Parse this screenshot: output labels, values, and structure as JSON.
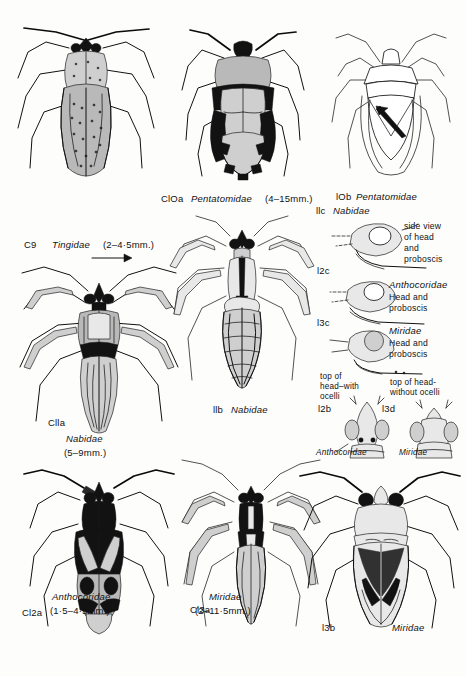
{
  "plate": {
    "title": "Hemiptera identification plate",
    "description": "Line-drawing plate of true bugs (Heteroptera) with keyed figures, family names and body-length ranges",
    "background_color": "#fdfdfc",
    "ink_color": "#111111"
  },
  "figures": [
    {
      "id": "c9",
      "code": "C9",
      "family": "Tingidae",
      "size": "(2–4·5mm.)",
      "caption_parts": [
        "C9",
        "Tingidae",
        "(2–4·5mm.)"
      ],
      "view": "dorsal whole-body, lace bug, heavily stippled",
      "has_arrow": true,
      "arrow_direction": "right"
    },
    {
      "id": "c10a",
      "code": "ClOa",
      "family": "Pentatomidae",
      "size": "(4–15mm.)",
      "caption_parts": [
        "ClOa",
        "Pentatomidae",
        "(4–15mm.)"
      ],
      "view": "dorsal whole-body, shield bug, dense black/grey pattern"
    },
    {
      "id": "f10b",
      "code": "lOb",
      "family": "Pentatomidae",
      "size": "",
      "caption_parts": [
        "lOb",
        "Pentatomidae"
      ],
      "view": "dorsal outline, shield bug with scutellum arrow"
    },
    {
      "id": "f11c",
      "code": "llc",
      "family": "Nabidae",
      "size": "",
      "caption_parts": [
        "llc",
        "Nabidae"
      ],
      "annotation": "side view of head and proboscis",
      "annotation_lines": [
        "side view",
        "of head",
        "and",
        "proboscis"
      ],
      "view": "lateral head detail"
    },
    {
      "id": "f12c",
      "code": "l2c",
      "family": "Anthocoridae",
      "size": "",
      "caption_parts": [
        "l2c",
        "Anthocoridae"
      ],
      "annotation": "Head and proboscis",
      "annotation_lines": [
        "Head and",
        "proboscis"
      ],
      "view": "lateral head detail"
    },
    {
      "id": "f13c",
      "code": "l3c",
      "family": "Miridae",
      "size": "",
      "caption_parts": [
        "l3c",
        "Miridae"
      ],
      "annotation": "Head and proboscis",
      "annotation_lines": [
        "Head and",
        "proboscis"
      ],
      "view": "lateral head detail"
    },
    {
      "id": "c11a",
      "code": "Clla",
      "family": "Nabidae",
      "size": "(5–9mm.)",
      "caption_parts": [
        "Clla",
        "Nabidae",
        "(5–9mm.)"
      ],
      "view": "dorsal whole-body, damsel bug"
    },
    {
      "id": "f11b",
      "code": "llb",
      "family": "Nabidae",
      "size": "",
      "caption_parts": [
        "llb",
        "Nabidae"
      ],
      "view": "dorsal whole-body, short-winged nymph-like form with abdomen banding"
    },
    {
      "id": "f12b",
      "code": "l2b",
      "family": "Anthocoridae",
      "size": "",
      "caption_parts": [
        "l2b",
        "Anthocoridae"
      ],
      "annotation": "top of head-with ocelli",
      "annotation_lines": [
        "top of",
        "head–with",
        "ocelli"
      ],
      "view": "dorsal head detail with two ocelli marked as black dots"
    },
    {
      "id": "f13d",
      "code": "l3d",
      "family": "Miridae",
      "size": "",
      "caption_parts": [
        "l3d",
        "Miridae"
      ],
      "annotation": "top of head-without ocelli",
      "annotation_lines": [
        "top of head-",
        "without ocelli"
      ],
      "view": "dorsal head detail without ocelli"
    },
    {
      "id": "c12a",
      "code": "Cl2a",
      "family": "Anthocoridae",
      "size": "(1·5–4·5mm.)",
      "caption_parts": [
        "Cl2a",
        "Anthocoridae",
        "(1·5–4·5mm.)"
      ],
      "view": "dorsal whole-body, flower bug with black and pale pattern",
      "has_arrow": true,
      "arrow_direction": "down-left"
    },
    {
      "id": "c13a",
      "code": "Cl3a",
      "family": "Miridae",
      "size": "(2–11·5mm.)",
      "caption_parts": [
        "Cl3a",
        "Miridae",
        "(2–11·5mm.)"
      ],
      "view": "dorsal whole-body, slender capsid bug"
    },
    {
      "id": "f13b",
      "code": "l3b",
      "family": "Miridae",
      "size": "",
      "caption_parts": [
        "l3b",
        "Miridae"
      ],
      "view": "dorsal whole-body, broad capsid bug with dark cuneus markings"
    }
  ],
  "labels": {
    "c9_code": "C9",
    "c9_family": "Tingidae",
    "c9_size": "(2–4·5mm.)",
    "c10a_code": "ClOa",
    "c10a_family": "Pentatomidae",
    "c10a_size": "(4–15mm.)",
    "f10b_code": "lOb",
    "f10b_family": "Pentatomidae",
    "f11c_code": "llc",
    "f11c_family": "Nabidae",
    "side_view_l1": "side view",
    "side_view_l2": "of head",
    "side_view_l3": "and",
    "side_view_l4": "proboscis",
    "f12c_code": "l2c",
    "f12c_family": "Anthocoridae",
    "f12c_note_l1": "Head and",
    "f12c_note_l2": "proboscis",
    "f13c_code": "l3c",
    "f13c_family": "Miridae",
    "f13c_note_l1": "Head and",
    "f13c_note_l2": "proboscis",
    "c11a_code": "Clla",
    "c11a_family": "Nabidae",
    "c11a_size": "(5–9mm.)",
    "f11b_code": "llb",
    "f11b_family": "Nabidae",
    "f12b_note_l1": "top of",
    "f12b_note_l2": "head–with",
    "f12b_note_l3": "ocelli",
    "f12b_code": "l2b",
    "f12b_family": "Anthocoridae",
    "f13d_note_l1": "top of head-",
    "f13d_note_l2": "without ocelli",
    "f13d_code": "l3d",
    "f13d_family": "Miridae",
    "c12a_code": "Cl2a",
    "c12a_family": "Anthocoridae",
    "c12a_size": "(1·5–4·5mm.)",
    "c13a_code": "Cl3a",
    "c13a_family": "Miridae",
    "c13a_size": "(2–11·5mm.)",
    "f13b_code": "l3b",
    "f13b_family": "Miridae"
  }
}
